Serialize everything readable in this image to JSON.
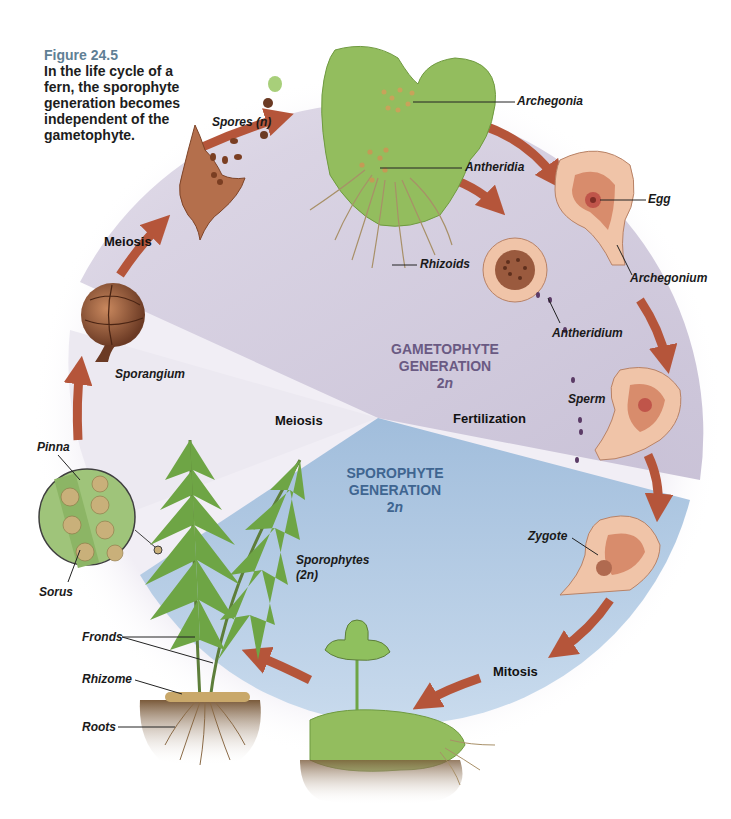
{
  "caption": {
    "figure": "Figure 24.5",
    "text": "In the life cycle of a fern, the sporophyte generation becomes independent of the gametophyte."
  },
  "generations": {
    "gametophyte": {
      "line1": "GAMETOPHYTE",
      "line2": "GENERATION",
      "ploidy_num": "2",
      "ploidy_n": "n"
    },
    "sporophyte": {
      "line1": "SPOROPHYTE",
      "line2": "GENERATION",
      "ploidy_num": "2",
      "ploidy_n": "n"
    }
  },
  "stages": {
    "meiosis_top": "Meiosis",
    "meiosis_center": "Meiosis",
    "fertilization": "Fertilization",
    "mitosis": "Mitosis"
  },
  "labels": {
    "spores": "Spores (n)",
    "archegonia": "Archegonia",
    "antheridia": "Antheridia",
    "rhizoids": "Rhizoids",
    "egg": "Egg",
    "archegonium": "Archegonium",
    "antheridium": "Antheridium",
    "sperm": "Sperm",
    "zygote": "Zygote",
    "sporangium": "Sporangium",
    "pinna": "Pinna",
    "sorus": "Sorus",
    "sporophytes": "Sporophytes",
    "sporophytes_ploidy": "(2n)",
    "fronds": "Fronds",
    "rhizome": "Rhizome",
    "roots": "Roots"
  },
  "colors": {
    "arrow": "#b5553a",
    "gametophyte_sector": "#cfc8db",
    "sporophyte_sector": "#a7c3df",
    "thallus": "#93bd5e",
    "fern": "#6ea545",
    "organ_outer": "#f0c4a8",
    "organ_inner": "#c86e58",
    "caption_figure": "#5f7f95"
  }
}
